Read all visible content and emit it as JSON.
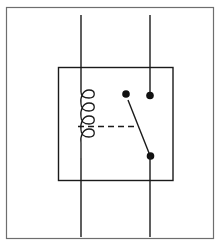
{
  "diagram": {
    "type": "schematic",
    "components": [
      {
        "id": "frame",
        "kind": "border"
      },
      {
        "id": "relay-housing",
        "kind": "enclosure"
      },
      {
        "id": "coil",
        "kind": "inductor-coil",
        "turns": 4
      },
      {
        "id": "mechanical-link",
        "kind": "dashed-linkage",
        "from": "coil",
        "to": "switch-arm"
      },
      {
        "id": "switch-arm",
        "kind": "pivoting-contact-arm",
        "state": "closed-to-lower-contact"
      },
      {
        "id": "contact-free",
        "kind": "contact-point"
      },
      {
        "id": "contact-fixed-top",
        "kind": "contact-point"
      },
      {
        "id": "contact-common",
        "kind": "contact-point"
      }
    ],
    "wires": [
      {
        "id": "coil-lead-top",
        "connects": [
          "external",
          "coil"
        ]
      },
      {
        "id": "coil-lead-bottom",
        "connects": [
          "coil",
          "external"
        ]
      },
      {
        "id": "switch-lead-top",
        "connects": [
          "external",
          "contact-fixed-top"
        ]
      },
      {
        "id": "switch-lead-bottom",
        "connects": [
          "contact-common",
          "external"
        ]
      }
    ],
    "colors": {
      "line": "#1a1a1a",
      "frame": "#6e6e6e",
      "background": "#ffffff"
    }
  }
}
